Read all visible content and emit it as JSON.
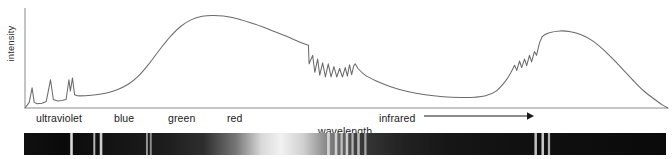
{
  "figure": {
    "type": "spectrum-plot",
    "background": "#ffffff",
    "line_color": "#6b6b6b",
    "axis_color": "#7a7a7a",
    "text_color": "#1a1a1a"
  },
  "axes": {
    "y_label": "intensity",
    "x_label": "wavelength",
    "y_axis": {
      "x": 25,
      "y_top": 8,
      "y_bottom": 108
    },
    "x_axis": {
      "y": 108,
      "x_left": 25,
      "x_right": 668
    },
    "grid": false,
    "ticks": []
  },
  "band_labels": [
    {
      "name": "ultraviolet",
      "text": "ultraviolet",
      "x": 36
    },
    {
      "name": "blue",
      "text": "blue",
      "x": 114
    },
    {
      "name": "green",
      "text": "green",
      "x": 168
    },
    {
      "name": "red",
      "text": "red",
      "x": 227
    },
    {
      "name": "infrared",
      "text": "infrared",
      "x": 379
    }
  ],
  "infrared_arrow": {
    "x_start": 424,
    "x_end": 534,
    "y": 116,
    "label": "infrared"
  },
  "chart_data": {
    "type": "line",
    "title": "",
    "xlabel": "wavelength",
    "ylabel": "intensity",
    "xlim": [
      0,
      1
    ],
    "ylim": [
      0,
      1
    ],
    "grid": false,
    "legend": null,
    "series": [
      {
        "name": "spectral intensity",
        "color": "#6b6b6b",
        "description": "Three narrow ultraviolet emission lines, a broad visible continuum peaking in the green/red region with an abrupt jagged absorption drop after red, a long infrared decline, and a second broad infrared hump with jagged rising edge.",
        "points": [
          [
            0.0,
            0.0
          ],
          [
            0.012,
            0.06
          ],
          [
            0.02,
            0.215
          ],
          [
            0.026,
            0.06
          ],
          [
            0.034,
            0.046
          ],
          [
            0.048,
            0.05
          ],
          [
            0.06,
            0.07
          ],
          [
            0.072,
            0.3
          ],
          [
            0.08,
            0.09
          ],
          [
            0.092,
            0.075
          ],
          [
            0.104,
            0.08
          ],
          [
            0.116,
            0.09
          ],
          [
            0.124,
            0.3
          ],
          [
            0.128,
            0.18
          ],
          [
            0.134,
            0.32
          ],
          [
            0.14,
            0.14
          ],
          [
            0.148,
            0.13
          ],
          [
            0.17,
            0.131
          ],
          [
            0.2,
            0.14
          ],
          [
            0.23,
            0.16
          ],
          [
            0.26,
            0.195
          ],
          [
            0.29,
            0.25
          ],
          [
            0.32,
            0.34
          ],
          [
            0.35,
            0.47
          ],
          [
            0.38,
            0.62
          ],
          [
            0.41,
            0.76
          ],
          [
            0.44,
            0.87
          ],
          [
            0.47,
            0.94
          ],
          [
            0.5,
            0.975
          ],
          [
            0.53,
            0.985
          ],
          [
            0.56,
            0.978
          ],
          [
            0.6,
            0.95
          ],
          [
            0.65,
            0.89
          ],
          [
            0.7,
            0.82
          ],
          [
            0.74,
            0.76
          ],
          [
            0.77,
            0.71
          ],
          [
            0.79,
            0.68
          ],
          [
            0.8,
            0.668
          ],
          [
            0.802,
            0.47
          ],
          [
            0.812,
            0.56
          ],
          [
            0.818,
            0.38
          ],
          [
            0.826,
            0.52
          ],
          [
            0.832,
            0.35
          ],
          [
            0.84,
            0.48
          ],
          [
            0.848,
            0.33
          ],
          [
            0.856,
            0.47
          ],
          [
            0.864,
            0.33
          ],
          [
            0.872,
            0.44
          ],
          [
            0.88,
            0.33
          ],
          [
            0.888,
            0.42
          ],
          [
            0.896,
            0.33
          ],
          [
            0.904,
            0.43
          ],
          [
            0.91,
            0.34
          ],
          [
            0.916,
            0.46
          ],
          [
            0.922,
            0.355
          ],
          [
            0.928,
            0.45
          ],
          [
            0.932,
            0.47
          ],
          [
            0.94,
            0.42
          ],
          [
            0.96,
            0.35
          ],
          [
            0.99,
            0.29
          ],
          [
            1.03,
            0.23
          ],
          [
            1.08,
            0.175
          ],
          [
            1.13,
            0.14
          ],
          [
            1.18,
            0.12
          ],
          [
            1.23,
            0.112
          ],
          [
            1.27,
            0.115
          ],
          [
            1.3,
            0.13
          ],
          [
            1.33,
            0.18
          ],
          [
            1.355,
            0.28
          ],
          [
            1.372,
            0.38
          ],
          [
            1.382,
            0.455
          ],
          [
            1.388,
            0.4
          ],
          [
            1.396,
            0.5
          ],
          [
            1.402,
            0.43
          ],
          [
            1.41,
            0.52
          ],
          [
            1.416,
            0.45
          ],
          [
            1.424,
            0.56
          ],
          [
            1.43,
            0.49
          ],
          [
            1.438,
            0.6
          ],
          [
            1.444,
            0.56
          ],
          [
            1.452,
            0.69
          ],
          [
            1.46,
            0.76
          ],
          [
            1.48,
            0.8
          ],
          [
            1.51,
            0.82
          ],
          [
            1.54,
            0.812
          ],
          [
            1.57,
            0.78
          ],
          [
            1.6,
            0.72
          ],
          [
            1.63,
            0.63
          ],
          [
            1.66,
            0.52
          ],
          [
            1.69,
            0.4
          ],
          [
            1.72,
            0.28
          ],
          [
            1.75,
            0.17
          ],
          [
            1.78,
            0.085
          ],
          [
            1.8,
            0.03
          ],
          [
            1.815,
            0.0
          ]
        ]
      }
    ]
  },
  "spectrum_strip": {
    "name": "absorption-spectrum-strip",
    "x": 24,
    "y": 133,
    "width": 642,
    "height": 22,
    "gradient_stops": [
      {
        "offset": 0.0,
        "color": "#101010"
      },
      {
        "offset": 0.06,
        "color": "#0a0a0a"
      },
      {
        "offset": 0.14,
        "color": "#141414"
      },
      {
        "offset": 0.22,
        "color": "#1d1d1d"
      },
      {
        "offset": 0.28,
        "color": "#2e2e2e"
      },
      {
        "offset": 0.33,
        "color": "#767676"
      },
      {
        "offset": 0.37,
        "color": "#d9d9d9"
      },
      {
        "offset": 0.4,
        "color": "#f2f2f2"
      },
      {
        "offset": 0.435,
        "color": "#d0d0d0"
      },
      {
        "offset": 0.47,
        "color": "#8a8a8a"
      },
      {
        "offset": 0.52,
        "color": "#3a3a3a"
      },
      {
        "offset": 0.58,
        "color": "#242424"
      },
      {
        "offset": 0.66,
        "color": "#161616"
      },
      {
        "offset": 0.78,
        "color": "#101010"
      },
      {
        "offset": 0.9,
        "color": "#0d0d0d"
      },
      {
        "offset": 1.0,
        "color": "#0a0a0a"
      }
    ],
    "absorption_lines": [
      {
        "x": 0.072,
        "w": 0.004,
        "color": "#ffffff",
        "opacity": 0.85
      },
      {
        "x": 0.108,
        "w": 0.003,
        "color": "#ffffff",
        "opacity": 0.7
      },
      {
        "x": 0.118,
        "w": 0.004,
        "color": "#ffffff",
        "opacity": 0.8
      },
      {
        "x": 0.19,
        "w": 0.003,
        "color": "#ffffff",
        "opacity": 0.55
      },
      {
        "x": 0.196,
        "w": 0.003,
        "color": "#ffffff",
        "opacity": 0.5
      },
      {
        "x": 0.472,
        "w": 0.0045,
        "color": "#ffffff",
        "opacity": 0.62
      },
      {
        "x": 0.484,
        "w": 0.004,
        "color": "#ffffff",
        "opacity": 0.66
      },
      {
        "x": 0.493,
        "w": 0.0035,
        "color": "#ffffff",
        "opacity": 0.6
      },
      {
        "x": 0.501,
        "w": 0.004,
        "color": "#ffffff",
        "opacity": 0.7
      },
      {
        "x": 0.51,
        "w": 0.0035,
        "color": "#ffffff",
        "opacity": 0.58
      },
      {
        "x": 0.519,
        "w": 0.004,
        "color": "#ffffff",
        "opacity": 0.64
      },
      {
        "x": 0.53,
        "w": 0.0035,
        "color": "#ffffff",
        "opacity": 0.55
      },
      {
        "x": 0.795,
        "w": 0.004,
        "color": "#ffffff",
        "opacity": 0.72
      },
      {
        "x": 0.806,
        "w": 0.004,
        "color": "#ffffff",
        "opacity": 0.76
      },
      {
        "x": 0.816,
        "w": 0.0035,
        "color": "#ffffff",
        "opacity": 0.68
      }
    ]
  }
}
